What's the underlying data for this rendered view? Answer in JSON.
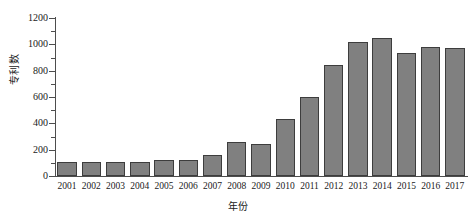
{
  "chart_data": {
    "type": "bar",
    "title": "",
    "xlabel": "年份",
    "ylabel": "专利数",
    "categories": [
      "2001",
      "2002",
      "2003",
      "2004",
      "2005",
      "2006",
      "2007",
      "2008",
      "2009",
      "2010",
      "2011",
      "2012",
      "2013",
      "2014",
      "2015",
      "2016",
      "2017"
    ],
    "values": [
      110,
      105,
      108,
      105,
      125,
      118,
      158,
      260,
      240,
      430,
      598,
      840,
      1015,
      1052,
      935,
      982,
      975
    ],
    "ylim": [
      0,
      1200
    ],
    "y_ticks": [
      0,
      200,
      400,
      600,
      800,
      1000,
      1200
    ],
    "y_tick_labels": [
      "0",
      "200",
      "400",
      "600",
      "800",
      "1000",
      "1200"
    ],
    "y_minor_ticks": [
      100,
      300,
      500,
      700,
      900,
      1100
    ],
    "grid": false,
    "legend": null,
    "legend_position": "none",
    "bar_color": "#808080",
    "bar_edge_color": "#3d3d3d",
    "axis_color": "#4d4d4d",
    "background_color": "#ffffff"
  }
}
